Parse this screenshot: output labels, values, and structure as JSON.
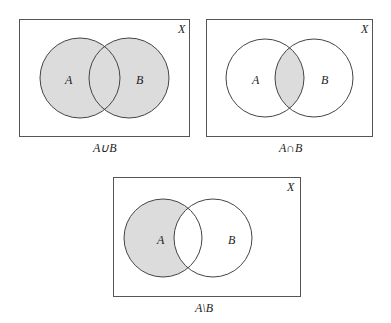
{
  "colors": {
    "shade": "#dcdcdc",
    "stroke": "#444444",
    "background": "#ffffff"
  },
  "diagrams": [
    {
      "universe_label": "X",
      "set_a_label": "A",
      "set_b_label": "B",
      "caption": "A∪B",
      "operation": "union"
    },
    {
      "universe_label": "X",
      "set_a_label": "A",
      "set_b_label": "B",
      "caption": "A∩B",
      "operation": "intersection"
    },
    {
      "universe_label": "X",
      "set_a_label": "A",
      "set_b_label": "B",
      "caption": "A\\B",
      "operation": "difference"
    }
  ]
}
